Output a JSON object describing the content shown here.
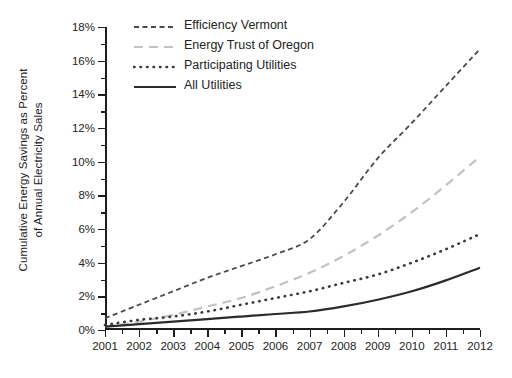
{
  "chart_data": {
    "type": "line",
    "title": "",
    "xlabel": "",
    "ylabel": "Cumulative Energy Savings as Percent of Annual Electricity Sales",
    "ylabel_line1": "Cumulative Energy Savings as Percent",
    "ylabel_line2": "of Annual Electricity Sales",
    "x": [
      2001,
      2002,
      2003,
      2004,
      2005,
      2006,
      2007,
      2008,
      2009,
      2010,
      2011,
      2012
    ],
    "xtick_labels": [
      "2001",
      "2002",
      "2003",
      "2004",
      "2005",
      "2006",
      "2007",
      "2008",
      "2009",
      "2010",
      "2011",
      "2012"
    ],
    "ytick_labels": [
      "0%",
      "2%",
      "4%",
      "6%",
      "8%",
      "10%",
      "12%",
      "14%",
      "16%",
      "18%"
    ],
    "ytick_values": [
      0,
      2,
      4,
      6,
      8,
      10,
      12,
      14,
      16,
      18
    ],
    "xlim": [
      2001,
      2012
    ],
    "ylim": [
      0,
      18
    ],
    "grid": false,
    "legend_position": "top-left-inside",
    "minor_ticks": true,
    "series": [
      {
        "name": "Efficiency Vermont",
        "style": "dashed",
        "color": "#4a4a4a",
        "width": 1.8,
        "dash": "5,3.5",
        "values": [
          0.7,
          1.5,
          2.3,
          3.1,
          3.8,
          4.5,
          5.4,
          7.6,
          10.2,
          12.3,
          14.5,
          16.7
        ]
      },
      {
        "name": "Energy Trust of Oregon",
        "style": "dashed-light",
        "color": "#c2c2c2",
        "width": 2.2,
        "dash": "9,6",
        "values": [
          0.2,
          0.5,
          0.9,
          1.4,
          1.9,
          2.6,
          3.4,
          4.4,
          5.6,
          7.0,
          8.6,
          10.3
        ]
      },
      {
        "name": "Participating Utilities",
        "style": "dotted",
        "color": "#3a3a3a",
        "width": 2.6,
        "dash": "0.5,6",
        "values": [
          0.3,
          0.6,
          0.8,
          1.1,
          1.5,
          1.9,
          2.3,
          2.8,
          3.3,
          4.0,
          4.8,
          5.7
        ]
      },
      {
        "name": "All Utilities",
        "style": "solid",
        "color": "#2b2b2b",
        "width": 2.2,
        "dash": "",
        "values": [
          0.2,
          0.35,
          0.5,
          0.65,
          0.8,
          0.95,
          1.1,
          1.4,
          1.8,
          2.3,
          2.95,
          3.7
        ]
      }
    ]
  },
  "legend": {
    "items": [
      {
        "label": "Efficiency Vermont"
      },
      {
        "label": "Energy Trust of Oregon"
      },
      {
        "label": "Participating Utilities"
      },
      {
        "label": "All Utilities"
      }
    ]
  }
}
